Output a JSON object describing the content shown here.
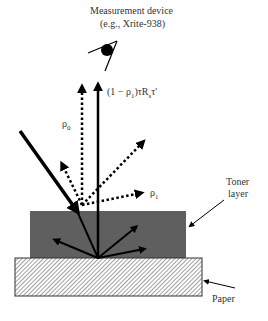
{
  "diagram": {
    "device_label_line1": "Measurement device",
    "device_label_line2": "(e.g., Xrite-938)",
    "rho0_label": "ρ",
    "rho0_sub": "0",
    "rho1_label": "ρ",
    "rho1_sub": "1",
    "transmitted_label": "(1 − ρ",
    "transmitted_sub": "1",
    "transmitted_rest": ")τR",
    "transmitted_sub2": "s",
    "transmitted_tail": "τ'",
    "toner_label_line1": "Toner",
    "toner_label_line2": "layer",
    "paper_label": "Paper",
    "colors": {
      "toner": "#5f5f5f",
      "paper_hatch": "#777777",
      "arrow": "#000000"
    }
  }
}
